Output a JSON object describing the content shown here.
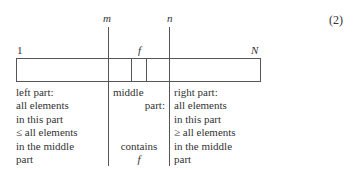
{
  "equation_number": "(2)",
  "array": {
    "start_label": "1",
    "end_label": "N",
    "pointer_m": "m",
    "pointer_n": "n",
    "element_f": "f"
  },
  "parts": {
    "left": {
      "lines": [
        "left part:",
        "all elements",
        "in this part",
        "≤ all elements",
        "in the middle",
        "part"
      ]
    },
    "middle": {
      "lines": [
        "middle",
        "part:",
        "",
        "",
        "contains",
        "f"
      ]
    },
    "right": {
      "lines": [
        "right part:",
        "all elements",
        "in this part",
        "≥ all elements",
        "in the middle",
        "part"
      ]
    }
  }
}
